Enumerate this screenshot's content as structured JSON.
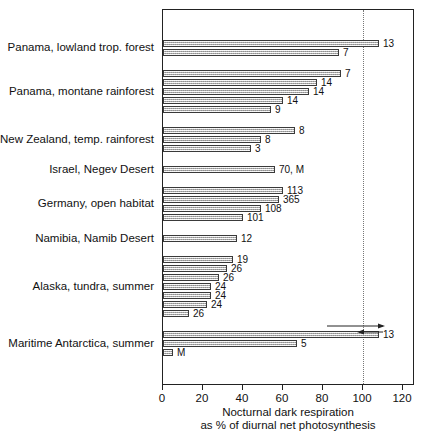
{
  "chart_data": {
    "type": "bar",
    "orientation": "horizontal",
    "title": "",
    "xlabel_line1": "Nocturnal dark respiration",
    "xlabel_line2": "as % of diurnal net photosynthesis",
    "ylabel": "",
    "xlim": [
      0,
      126
    ],
    "xticks": [
      0,
      20,
      40,
      60,
      80,
      100,
      120
    ],
    "xtick_labels": [
      "0",
      "20",
      "40",
      "60",
      "80",
      "100",
      "120"
    ],
    "grid": "dotted vertical reference line at 100",
    "reference_line": 100,
    "legend": "none",
    "categories": [
      "Panama, lowland trop. forest",
      "Panama, montane rainforest",
      "New Zealand, temp. rainforest",
      "Israel, Negev Desert",
      "Germany, open habitat",
      "Namibia, Namib Desert",
      "Alaska, tundra, summer",
      "Maritime Antarctica, summer"
    ],
    "groups": [
      {
        "category": "Panama, lowland trop. forest",
        "bars": [
          {
            "value": 108,
            "label": "13"
          },
          {
            "value": 88,
            "label": "7"
          }
        ]
      },
      {
        "category": "Panama, montane rainforest",
        "bars": [
          {
            "value": 89,
            "label": "7"
          },
          {
            "value": 77,
            "label": "14"
          },
          {
            "value": 73,
            "label": "14"
          },
          {
            "value": 60,
            "label": "14"
          },
          {
            "value": 54,
            "label": "9"
          }
        ]
      },
      {
        "category": "New Zealand, temp. rainforest",
        "bars": [
          {
            "value": 66,
            "label": "8"
          },
          {
            "value": 49,
            "label": "8"
          },
          {
            "value": 44,
            "label": "3"
          }
        ]
      },
      {
        "category": "Israel, Negev Desert",
        "bars": [
          {
            "value": 56,
            "label": "70, M"
          }
        ]
      },
      {
        "category": "Germany, open habitat",
        "bars": [
          {
            "value": 60,
            "label": "113"
          },
          {
            "value": 58,
            "label": "365"
          },
          {
            "value": 49,
            "label": "108"
          },
          {
            "value": 40,
            "label": "101"
          }
        ]
      },
      {
        "category": "Namibia, Namib Desert",
        "bars": [
          {
            "value": 37,
            "label": "12"
          }
        ]
      },
      {
        "category": "Alaska, tundra, summer",
        "bars": [
          {
            "value": 35,
            "label": "19"
          },
          {
            "value": 32,
            "label": "26"
          },
          {
            "value": 28,
            "label": "26"
          },
          {
            "value": 24,
            "label": "24"
          },
          {
            "value": 24,
            "label": "24"
          },
          {
            "value": 22,
            "label": "24"
          },
          {
            "value": 13,
            "label": "26"
          }
        ]
      },
      {
        "category": "Maritime Antarctica, summer",
        "bars": [
          {
            "value": 108,
            "label": "13",
            "annotation": "double-headed-range-arrow"
          },
          {
            "value": 67,
            "label": "5"
          },
          {
            "value": 5,
            "label": "M"
          }
        ]
      }
    ],
    "colors": {
      "bar_fill": "#d2d2d2",
      "bar_outline": "#3a3a3a",
      "axis": "#222222",
      "reference_line": "#777777",
      "text": "#111111",
      "background": "#ffffff"
    }
  }
}
